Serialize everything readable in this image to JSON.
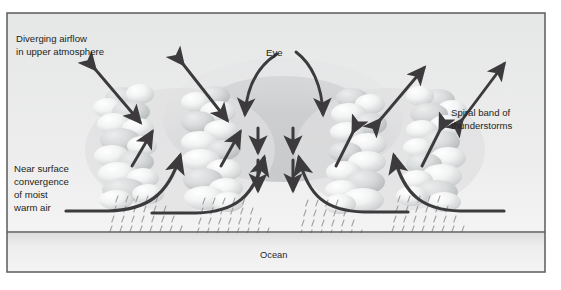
{
  "figure": {
    "border_color": "#5b5b5b",
    "sky_color": "#e9eaea",
    "cloud_color": "#d8d9d9",
    "cloud_highlight": "#f7f8f8",
    "arrow_color": "#3c3a3c",
    "ocean_color": "#e3e4e4",
    "rain_color": "#9a9b9d",
    "text_color": "#231f20"
  },
  "labels": {
    "diverging": {
      "line1": "Diverging airflow",
      "line2": "in upper atmosphere"
    },
    "eye": "Eye",
    "spiral": {
      "line1": "Spiral band of",
      "line2": "thunderstorms"
    },
    "near_surface": {
      "line1": "Near surface",
      "line2": "convergence",
      "line3": "of moist",
      "line4": "warm air"
    },
    "ocean": "Ocean"
  },
  "bleed_through": {
    "note": "faint mirrored show-through text from reverse of printed page",
    "lines": [
      "severe weather",
      "williams",
      "dramatic tropical",
      "a tropical storm"
    ]
  },
  "elements": {
    "outflow_arrows": 4,
    "eye_descent_arrows": 2,
    "eyewall_inflow_arrows": 4,
    "curved_eye_arrows": 2,
    "rain_shafts": 4,
    "cloud_towers": 4
  }
}
